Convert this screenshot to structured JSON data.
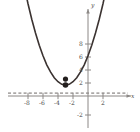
{
  "chart_data": {
    "type": "line",
    "title": "",
    "subtitle": "",
    "xlabel": "x",
    "ylabel": "y",
    "xlim": [
      -9.2,
      3.4
    ],
    "ylim": [
      -3.2,
      9.6
    ],
    "grid": false,
    "legend": null,
    "axis_origin": [
      0,
      0
    ],
    "x_ticks": [
      -8,
      -6,
      -4,
      -2,
      2
    ],
    "x_tick_labels": [
      "-8",
      "-6",
      "-4",
      "-2",
      "2"
    ],
    "x_minor_ticks": [
      -9,
      -7,
      -5,
      -3,
      -1,
      1,
      3
    ],
    "y_ticks": [
      2,
      4,
      6,
      8,
      -2
    ],
    "y_tick_labels": [
      "2",
      "4",
      "6",
      "8",
      "-2"
    ],
    "series": [
      {
        "name": "parabola",
        "type": "curve",
        "color": "#3b3331",
        "equation": "y = 0.5*(x + 3)^2 + 1.7",
        "vertex": [
          -3,
          1.7
        ],
        "x_range": [
          -8.6,
          2.6
        ],
        "points": [
          [
            -8.6,
            17.4
          ],
          [
            -8.0,
            14.2
          ],
          [
            -7.5,
            11.8
          ],
          [
            -7.0,
            9.7
          ],
          [
            -6.5,
            7.8
          ],
          [
            -6.0,
            6.2
          ],
          [
            -5.5,
            4.8
          ],
          [
            -5.0,
            3.7
          ],
          [
            -4.5,
            2.8
          ],
          [
            -4.0,
            2.2
          ],
          [
            -3.5,
            1.8
          ],
          [
            -3.0,
            1.7
          ],
          [
            -2.5,
            1.8
          ],
          [
            -2.0,
            2.2
          ],
          [
            -1.5,
            2.8
          ],
          [
            -1.0,
            3.7
          ],
          [
            -0.5,
            4.8
          ],
          [
            0.0,
            6.2
          ],
          [
            0.5,
            7.8
          ],
          [
            1.0,
            9.7
          ],
          [
            1.5,
            11.8
          ],
          [
            2.0,
            14.2
          ],
          [
            2.6,
            17.4
          ]
        ]
      },
      {
        "name": "marked-points",
        "type": "scatter",
        "color": "#231f1e",
        "points": [
          [
            -3.0,
            2.6
          ],
          [
            -3.0,
            1.7
          ]
        ]
      },
      {
        "name": "dashed-horizontal-line",
        "type": "hline",
        "color": "#6f6a68",
        "style": "dashed",
        "y": 0.45,
        "x_range": [
          -9.2,
          3.2
        ]
      }
    ],
    "annotations": []
  },
  "axes": {
    "x_axis_label": "x",
    "y_axis_label": "y",
    "x_arrow": "right-arrow",
    "y_arrow": "up-arrow"
  },
  "colors": {
    "curve": "#3b3331",
    "point": "#231f1e",
    "axis": "#8c8886",
    "tick_text": "#4a4a4a",
    "dashed_line": "#6f6a68",
    "background": "#ffffff"
  }
}
